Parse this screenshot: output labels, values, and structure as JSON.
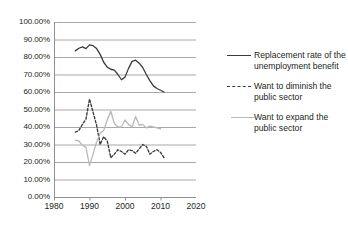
{
  "chart_data": {
    "type": "line",
    "title": "",
    "xlabel": "",
    "ylabel": "",
    "xlim": [
      1980,
      2020
    ],
    "ylim": [
      0,
      1
    ],
    "grid": true,
    "gridlines": "horizontal",
    "legend_position": "right",
    "y_tick_labels": [
      "100.00%",
      "90.00%",
      "80.00%",
      "70.00%",
      "60.00%",
      "50.00%",
      "40.00%",
      "30.00%",
      "20.00%",
      "10.00%",
      "0.00%"
    ],
    "y_tick_values": [
      100,
      90,
      80,
      70,
      60,
      50,
      40,
      30,
      20,
      10,
      0
    ],
    "x_tick_labels": [
      "1980",
      "1990",
      "2000",
      "2010",
      "2020"
    ],
    "x_tick_values": [
      1980,
      1990,
      2000,
      2010,
      2020
    ],
    "series": [
      {
        "name": "Replacement rate of the unemployment benefit",
        "style": "solid",
        "color": "#3b3b3f",
        "x": [
          1986,
          1987,
          1988,
          1989,
          1990,
          1991,
          1992,
          1993,
          1994,
          1995,
          1996,
          1997,
          1998,
          1999,
          2000,
          2001,
          2002,
          2003,
          2004,
          2005,
          2006,
          2007,
          2008,
          2009,
          2010,
          2011
        ],
        "values": [
          83.5,
          85.0,
          85.8,
          84.8,
          86.9,
          86.5,
          84.8,
          81.5,
          77.0,
          74.2,
          73.0,
          72.5,
          70.0,
          67.0,
          68.5,
          73.5,
          77.5,
          78.2,
          76.5,
          74.0,
          70.0,
          66.5,
          63.5,
          62.0,
          61.0,
          60.0
        ]
      },
      {
        "name": "Want to diminish the public sector",
        "style": "dashed",
        "color": "#3b3b3f",
        "x": [
          1986,
          1987,
          1988,
          1989,
          1990,
          1991,
          1992,
          1993,
          1994,
          1995,
          1996,
          1997,
          1998,
          1999,
          2000,
          2001,
          2002,
          2003,
          2004,
          2005,
          2006,
          2007,
          2008,
          2009,
          2010,
          2011
        ],
        "values": [
          37.0,
          38.0,
          41.5,
          44.5,
          56.0,
          48.5,
          41.0,
          30.0,
          34.5,
          32.0,
          22.5,
          24.5,
          27.0,
          26.0,
          24.5,
          27.0,
          26.5,
          25.0,
          27.5,
          30.0,
          29.0,
          24.5,
          26.0,
          27.0,
          25.5,
          22.5
        ]
      },
      {
        "name": "Want to expand the public sector",
        "style": "solid",
        "color": "#b9b9bb",
        "x": [
          1986,
          1987,
          1988,
          1989,
          1990,
          1991,
          1992,
          1993,
          1994,
          1995,
          1996,
          1997,
          1998,
          1999,
          2000,
          2001,
          2002,
          2003,
          2004,
          2005,
          2006,
          2007,
          2008,
          2009,
          2010
        ],
        "values": [
          32.5,
          32.0,
          29.5,
          28.5,
          18.0,
          24.5,
          31.5,
          36.5,
          38.0,
          44.0,
          49.0,
          42.0,
          40.0,
          40.0,
          44.0,
          41.5,
          40.0,
          46.0,
          41.0,
          41.5,
          39.5,
          40.5,
          40.0,
          39.5,
          39.0
        ]
      }
    ]
  },
  "legend": {
    "entries": [
      {
        "label": "Replacement rate of the unemployment benefit",
        "swatch": "solid-dark-line-icon"
      },
      {
        "label": "Want to diminish the public sector",
        "swatch": "dashed-dark-line-icon"
      },
      {
        "label": "Want to expand the public sector",
        "swatch": "solid-light-line-icon"
      }
    ]
  },
  "colors": {
    "series_dark": "#3b3b3f",
    "series_light": "#b9b9bb",
    "gridline": "#a8a8aa",
    "axis": "#8f8f91",
    "text": "#231f20",
    "background": "#ffffff"
  }
}
